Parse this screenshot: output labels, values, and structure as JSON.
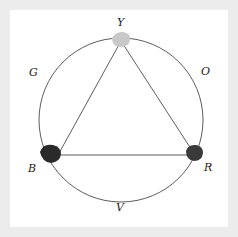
{
  "diagram": {
    "type": "color-wheel",
    "labels": {
      "top": "Y",
      "upper_right": "O",
      "lower_right": "R",
      "bottom": "V",
      "lower_left": "B",
      "upper_left": "G"
    },
    "primaries": [
      {
        "name": "Y",
        "color": "#c8c8c8"
      },
      {
        "name": "R",
        "color": "#3a3a3a"
      },
      {
        "name": "B",
        "color": "#2a2a2a"
      }
    ],
    "colors": {
      "background": "#ececec",
      "panel": "#ffffff",
      "stroke": "#333333"
    }
  }
}
